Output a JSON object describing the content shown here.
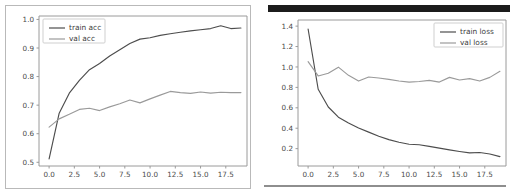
{
  "figure": {
    "panels": [
      {
        "name": "accuracy",
        "title": "",
        "legend": [
          {
            "label": "train acc",
            "color": "#4d4d4d"
          },
          {
            "label": "val acc",
            "color": "#9a9a9a"
          }
        ]
      },
      {
        "name": "loss",
        "title": "",
        "legend": [
          {
            "label": "train loss",
            "color": "#4d4d4d"
          },
          {
            "label": "val loss",
            "color": "#9a9a9a"
          }
        ]
      }
    ]
  },
  "chart_data": [
    {
      "type": "line",
      "name": "accuracy",
      "title": "",
      "xlabel": "",
      "ylabel": "",
      "xlim": [
        -1.0,
        19.6
      ],
      "ylim": [
        0.487,
        1.012
      ],
      "grid": false,
      "legend_position": "upper left",
      "xticks": [
        "0.0",
        "2.5",
        "5.0",
        "7.5",
        "10.0",
        "12.5",
        "15.0",
        "17.5"
      ],
      "xtick_values": [
        0.0,
        2.5,
        5.0,
        7.5,
        10.0,
        12.5,
        15.0,
        17.5
      ],
      "yticks": [
        "0.5",
        "0.6",
        "0.7",
        "0.8",
        "0.9",
        "1.0"
      ],
      "ytick_values": [
        0.5,
        0.6,
        0.7,
        0.8,
        0.9,
        1.0
      ],
      "x": [
        0,
        1,
        2,
        3,
        4,
        5,
        6,
        7,
        8,
        9,
        10,
        11,
        12,
        13,
        14,
        15,
        16,
        17,
        18,
        19
      ],
      "series": [
        {
          "name": "train acc",
          "color": "#4d4d4d",
          "values": [
            0.512,
            0.672,
            0.742,
            0.787,
            0.824,
            0.846,
            0.872,
            0.894,
            0.916,
            0.931,
            0.936,
            0.944,
            0.95,
            0.955,
            0.96,
            0.964,
            0.968,
            0.978,
            0.968,
            0.97
          ]
        },
        {
          "name": "val acc",
          "color": "#9a9a9a",
          "values": [
            0.623,
            0.652,
            0.668,
            0.685,
            0.689,
            0.681,
            0.694,
            0.705,
            0.718,
            0.708,
            0.722,
            0.735,
            0.748,
            0.744,
            0.741,
            0.746,
            0.742,
            0.745,
            0.744,
            0.744
          ]
        }
      ]
    },
    {
      "type": "line",
      "name": "loss",
      "title": "",
      "xlabel": "",
      "ylabel": "",
      "xlim": [
        -1.0,
        19.6
      ],
      "ylim": [
        0.03,
        1.46
      ],
      "grid": false,
      "legend_position": "upper right",
      "xticks": [
        "0.0",
        "2.5",
        "5.0",
        "7.5",
        "10.0",
        "12.5",
        "15.0",
        "17.5"
      ],
      "xtick_values": [
        0.0,
        2.5,
        5.0,
        7.5,
        10.0,
        12.5,
        15.0,
        17.5
      ],
      "yticks": [
        "0.2",
        "0.4",
        "0.6",
        "0.8",
        "1.0",
        "1.2",
        "1.4"
      ],
      "ytick_values": [
        0.2,
        0.4,
        0.6,
        0.8,
        1.0,
        1.2,
        1.4
      ],
      "x": [
        0,
        1,
        2,
        3,
        4,
        5,
        6,
        7,
        8,
        9,
        10,
        11,
        12,
        13,
        14,
        15,
        16,
        17,
        18,
        19
      ],
      "series": [
        {
          "name": "train loss",
          "color": "#4d4d4d",
          "values": [
            1.372,
            0.782,
            0.608,
            0.508,
            0.452,
            0.402,
            0.362,
            0.322,
            0.288,
            0.262,
            0.243,
            0.238,
            0.222,
            0.205,
            0.188,
            0.172,
            0.158,
            0.162,
            0.148,
            0.122
          ]
        },
        {
          "name": "val loss",
          "color": "#9a9a9a",
          "values": [
            1.052,
            0.912,
            0.938,
            0.998,
            0.918,
            0.862,
            0.902,
            0.892,
            0.878,
            0.862,
            0.852,
            0.858,
            0.868,
            0.852,
            0.898,
            0.872,
            0.886,
            0.862,
            0.898,
            0.958
          ]
        }
      ]
    }
  ]
}
